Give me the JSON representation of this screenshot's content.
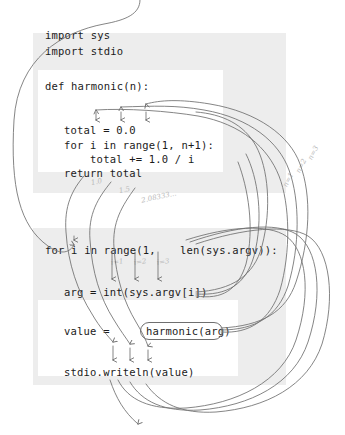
{
  "figure": {
    "colors": {
      "panel_gray": "#e2e2e2",
      "code_white": "#ffffff",
      "wire_gray": "#6f6f6f",
      "annotation_gray": "#b9b9b9",
      "code_text": "#1b1b1b",
      "page_background": "#ffffff"
    }
  },
  "top_block": {
    "header_lines": [
      "import sys",
      "import stdio"
    ],
    "def_line": "def harmonic(n):",
    "body_lines": [
      "total = 0.0",
      "for i in range(1, n+1):",
      "    total += 1.0 / i",
      "return total"
    ],
    "full_source": "import sys\nimport stdio\n\ndef harmonic(n):\n    total = 0.0\n    for i in range(1, n+1):\n        total += 1.0 / i\n    return total"
  },
  "bottom_block": {
    "for_line_left": "for i in range(1,",
    "for_line_right": "len(sys.argv)):",
    "arg_line": "arg = int(sys.argv[i])",
    "value_line_left": "value =",
    "call_expression": "harmonic(arg)",
    "writeln_line": "stdio.writeln(value)",
    "full_source": "for i in range(1, len(sys.argv)):\n    arg = int(sys.argv[i])\n\n    value = harmonic(arg)\n\n    stdio.writeln(value)"
  },
  "annotations": {
    "return_values": [
      {
        "label": "1.0",
        "x": 91,
        "y": 178
      },
      {
        "label": "1.5",
        "x": 119,
        "y": 186
      },
      {
        "label": "2.08333...",
        "x": 141,
        "y": 193
      }
    ],
    "argument_values": [
      {
        "label": "n=3",
        "x": 306,
        "y": 149
      },
      {
        "label": "n=2",
        "x": 294,
        "y": 162
      },
      {
        "label": "n=1",
        "x": 281,
        "y": 176
      }
    ],
    "loop_indices": [
      {
        "label": "i=1",
        "x": 111,
        "y": 258
      },
      {
        "label": "i=2",
        "x": 134,
        "y": 258
      },
      {
        "label": "i=3",
        "x": 157,
        "y": 258
      }
    ]
  },
  "call_highlight": {
    "text": "harmonic(arg)",
    "x": 140,
    "y": 322,
    "width": 81,
    "height": 16
  }
}
